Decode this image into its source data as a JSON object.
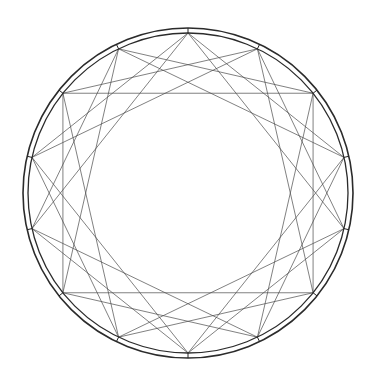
{
  "diagram": {
    "type": "star-polygon-string-art",
    "vertex_count": 14,
    "chord_steps": [
      3,
      4
    ],
    "center": [
      188,
      193
    ],
    "vertex_radius": 160,
    "rings": [
      {
        "name": "outer-ring",
        "radius": 165,
        "stroke": "#2b2b2b",
        "width": 1.6
      },
      {
        "name": "inner-ring",
        "radius": 160,
        "stroke": "#2b2b2b",
        "width": 1.3
      }
    ],
    "chord_color": "#4a4a4a",
    "chord_width": 0.7,
    "vertex_tick_color": "#222222",
    "background": "#ffffff"
  }
}
